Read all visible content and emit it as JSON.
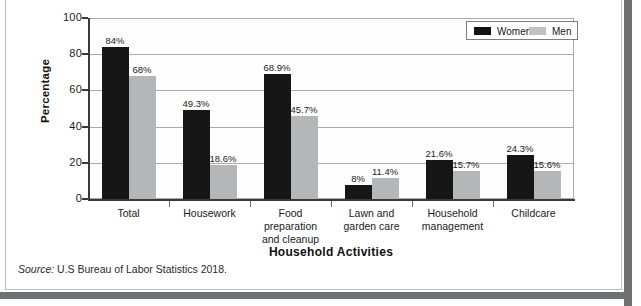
{
  "chart_data": {
    "type": "bar",
    "title": "",
    "xlabel": "Household Activities",
    "ylabel": "Percentage",
    "ylim": [
      0,
      100
    ],
    "yticks": [
      0,
      20,
      40,
      60,
      80,
      100
    ],
    "grid": true,
    "legend_position": "top-right",
    "categories": [
      "Total",
      "Housework",
      "Food\npreparation\nand cleanup",
      "Lawn and\ngarden care",
      "Household\nmanagement",
      "Childcare"
    ],
    "series": [
      {
        "name": "Women",
        "color": "#161616",
        "values": [
          84,
          49.3,
          68.9,
          8,
          21.6,
          24.3
        ],
        "labels": [
          "84%",
          "49.3%",
          "68.9%",
          "8%",
          "21.6%",
          "24.3%"
        ]
      },
      {
        "name": "Men",
        "color": "#b5b6b8",
        "values": [
          68,
          18.6,
          45.7,
          11.4,
          15.7,
          15.6
        ],
        "labels": [
          "68%",
          "18.6%",
          "45.7%",
          "11.4%",
          "15.7%",
          "15.6%"
        ]
      }
    ]
  },
  "legend": {
    "items": [
      {
        "label": "Women",
        "color": "#161616"
      },
      {
        "label": "Men",
        "color": "#b5b6b8"
      }
    ]
  },
  "axis": {
    "y_title": "Percentage",
    "x_title": "Household Activities",
    "y_tick_labels": [
      "100",
      "80",
      "60",
      "40",
      "20",
      "0"
    ]
  },
  "source": {
    "prefix": "Source:",
    "text": "U.S Bureau of Labor Statistics 2018."
  }
}
